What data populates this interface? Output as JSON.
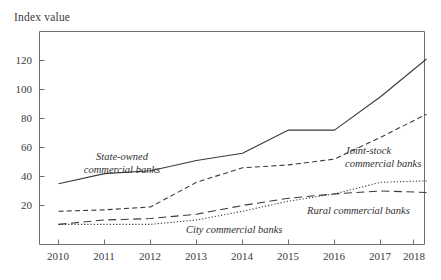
{
  "axis_title": "Index value",
  "chart_data": {
    "type": "line",
    "title": "",
    "subtitle": "",
    "xlabel": "",
    "ylabel": "Index value",
    "grid": false,
    "legend_position": "inline-annotations",
    "x": [
      2010,
      2011,
      2012,
      2013,
      2014,
      2015,
      2016,
      2017,
      2018
    ],
    "categories": [
      "2010",
      "2011",
      "2012",
      "2013",
      "2014",
      "2015",
      "2016",
      "2017",
      "2018"
    ],
    "xlim": [
      2010,
      2018
    ],
    "ylim": [
      0,
      133
    ],
    "ytick_labels": [
      "20",
      "40",
      "60",
      "80",
      "100",
      "120"
    ],
    "yticks": [
      20,
      40,
      60,
      80,
      100,
      120
    ],
    "series": [
      {
        "name": "State-owned commercial banks",
        "style": "solid",
        "color": "#3a3a3a",
        "values": [
          35,
          42,
          44,
          51,
          56,
          72,
          72,
          95,
          121
        ]
      },
      {
        "name": "Joint-stock commercial banks",
        "style": "dashed",
        "color": "#3a3a3a",
        "values": [
          16,
          17,
          19,
          36,
          46,
          48,
          52,
          67,
          83
        ]
      },
      {
        "name": "Rural commercial banks",
        "style": "long-dash",
        "color": "#3a3a3a",
        "values": [
          7,
          10,
          11,
          14,
          20,
          25,
          28,
          30,
          29
        ]
      },
      {
        "name": "City commercial banks",
        "style": "dotted",
        "color": "#3a3a3a",
        "values": [
          7,
          7,
          7,
          10,
          16,
          23,
          28,
          36,
          37
        ]
      }
    ],
    "annotations": [
      {
        "text_line1": "State-owned",
        "text_line2": "commercial banks"
      },
      {
        "text_line1": "Joint-stock",
        "text_line2": "commercial banks"
      },
      {
        "text_line1": "Rural commercial banks",
        "text_line2": ""
      },
      {
        "text_line1": "City commercial banks",
        "text_line2": ""
      }
    ]
  }
}
